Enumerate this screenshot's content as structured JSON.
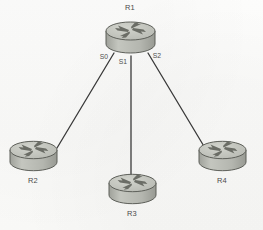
{
  "diagram": {
    "type": "network-topology",
    "background_color": "#fbfbfa",
    "line_color": "#3a3a3a",
    "device_body_color": "#b9bbb4",
    "device_top_color": "#c9cbc4",
    "device_glyph_color": "#6b6d66",
    "device_outline_color": "#5d5f59"
  },
  "devices": [
    {
      "id": "r1",
      "label": "R1",
      "icon": "router-icon",
      "label_position": "top",
      "x": 130,
      "y": 37,
      "width": 52,
      "height": 34,
      "label_x": 130,
      "label_y": 7
    },
    {
      "id": "r2",
      "label": "R2",
      "icon": "router-icon",
      "label_position": "bottom",
      "x": 33,
      "y": 155,
      "width": 50,
      "height": 33,
      "label_x": 33,
      "label_y": 176
    },
    {
      "id": "r3",
      "label": "R3",
      "icon": "router-icon",
      "label_position": "bottom",
      "x": 132,
      "y": 188,
      "width": 50,
      "height": 33,
      "label_x": 132,
      "label_y": 209
    },
    {
      "id": "r4",
      "label": "R4",
      "icon": "router-icon",
      "label_position": "bottom",
      "x": 222,
      "y": 155,
      "width": 50,
      "height": 33,
      "label_x": 222,
      "label_y": 176
    }
  ],
  "links": [
    {
      "id": "link-r1-r2",
      "from": "r1",
      "to": "r2",
      "interface_label": "S0",
      "x1": 114,
      "y1": 53,
      "x2": 57,
      "y2": 148,
      "label_x": 104,
      "label_y": 53
    },
    {
      "id": "link-r1-r3",
      "from": "r1",
      "to": "r3",
      "interface_label": "S1",
      "x1": 131,
      "y1": 56,
      "x2": 131,
      "y2": 180,
      "label_x": 123,
      "label_y": 58
    },
    {
      "id": "link-r1-r4",
      "from": "r1",
      "to": "r4",
      "interface_label": "S2",
      "x1": 148,
      "y1": 53,
      "x2": 205,
      "y2": 148,
      "label_x": 157,
      "label_y": 52
    }
  ]
}
